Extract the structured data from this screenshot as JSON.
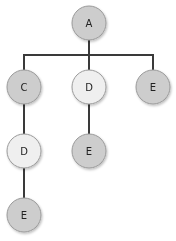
{
  "colors": {
    "dark_node": "#cdcdcd",
    "light_node": "#efefef",
    "edge": "#3a3a3a",
    "label": "#222222"
  },
  "tree": {
    "nodes": [
      {
        "id": "n1",
        "label": "A",
        "shade": "dark",
        "cx": 89,
        "cy": 23
      },
      {
        "id": "n2",
        "label": "C",
        "shade": "dark",
        "cx": 24,
        "cy": 87
      },
      {
        "id": "n3",
        "label": "D",
        "shade": "light",
        "cx": 89,
        "cy": 87
      },
      {
        "id": "n4",
        "label": "E",
        "shade": "dark",
        "cx": 153,
        "cy": 87
      },
      {
        "id": "n5",
        "label": "D",
        "shade": "light",
        "cx": 24,
        "cy": 151
      },
      {
        "id": "n6",
        "label": "E",
        "shade": "dark",
        "cx": 89,
        "cy": 151
      },
      {
        "id": "n7",
        "label": "E",
        "shade": "dark",
        "cx": 24,
        "cy": 215
      }
    ],
    "edges": [
      {
        "from": "A",
        "to": "C"
      },
      {
        "from": "A",
        "to": "D"
      },
      {
        "from": "A",
        "to": "E"
      },
      {
        "from": "C",
        "to": "D"
      },
      {
        "from": "D",
        "to": "E"
      },
      {
        "from": "D",
        "to": "E"
      }
    ]
  }
}
